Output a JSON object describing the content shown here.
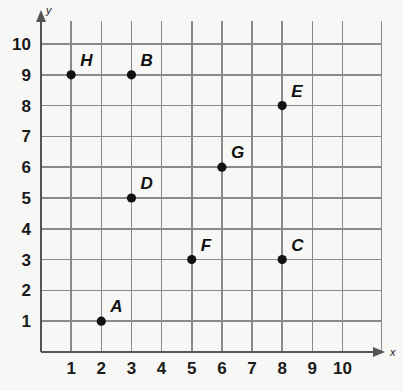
{
  "chart_data": {
    "type": "scatter",
    "title": "",
    "xlabel": "x",
    "ylabel": "y",
    "xlim": [
      0,
      10.6
    ],
    "ylim": [
      0,
      10.6
    ],
    "grid": true,
    "legend": "none",
    "x_ticks": [
      1,
      2,
      3,
      4,
      5,
      6,
      7,
      8,
      9,
      10
    ],
    "y_ticks": [
      1,
      2,
      3,
      4,
      5,
      6,
      7,
      8,
      9,
      10
    ],
    "x_tick_labels": [
      "1",
      "2",
      "3",
      "4",
      "5",
      "6",
      "7",
      "8",
      "9",
      "10"
    ],
    "y_tick_labels": [
      "1",
      "2",
      "3",
      "4",
      "5",
      "6",
      "7",
      "8",
      "9",
      "10"
    ],
    "point_color": "#111111",
    "grid_color": "#8a8a8a",
    "axis_color": "#555555",
    "background_color": "#f7f7f5",
    "points": [
      {
        "label": "A",
        "x": 2,
        "y": 1
      },
      {
        "label": "B",
        "x": 3,
        "y": 9
      },
      {
        "label": "C",
        "x": 8,
        "y": 3
      },
      {
        "label": "D",
        "x": 3,
        "y": 5
      },
      {
        "label": "E",
        "x": 8,
        "y": 8
      },
      {
        "label": "F",
        "x": 5,
        "y": 3
      },
      {
        "label": "G",
        "x": 6,
        "y": 6
      },
      {
        "label": "H",
        "x": 1,
        "y": 9
      }
    ]
  },
  "axes": {
    "x_axis_name": "x",
    "y_axis_name": "y"
  }
}
